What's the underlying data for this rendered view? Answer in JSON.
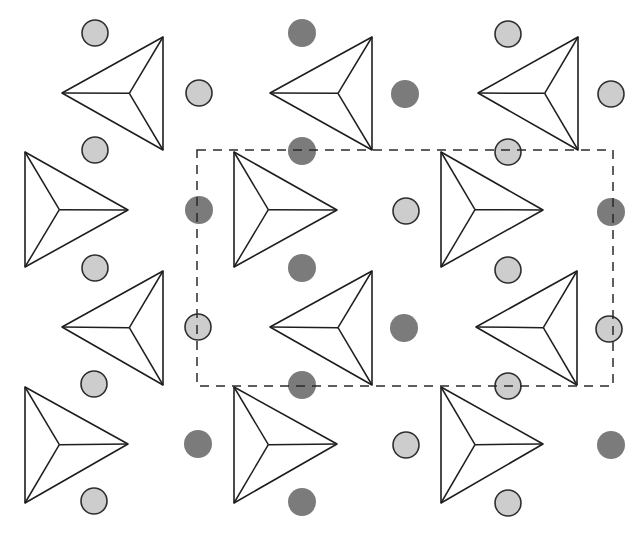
{
  "diagram": {
    "title": "",
    "colors": {
      "background": "#ffffff",
      "line": "#1e1e1e",
      "light_atom_fill": "#cdcdcd",
      "light_atom_stroke": "#2e2e2e",
      "dark_atom_fill": "#7b7b7b",
      "unit_cell": "#2a2a2a"
    },
    "unit_cell": {
      "x": 197,
      "y": 150,
      "width": 416,
      "height": 236,
      "style": "dashed"
    },
    "tetrahedra": [
      {
        "orientation": "left",
        "tip": [
          62,
          93
        ],
        "base_x": 163,
        "top": 37,
        "bottom": 150
      },
      {
        "orientation": "left",
        "tip": [
          270,
          93
        ],
        "base_x": 372,
        "top": 37,
        "bottom": 150
      },
      {
        "orientation": "left",
        "tip": [
          478,
          93
        ],
        "base_x": 578,
        "top": 37,
        "bottom": 150
      },
      {
        "orientation": "right",
        "tip": [
          128,
          210
        ],
        "base_x": 25,
        "top": 152,
        "bottom": 267
      },
      {
        "orientation": "right",
        "tip": [
          337,
          210
        ],
        "base_x": 234,
        "top": 152,
        "bottom": 267
      },
      {
        "orientation": "right",
        "tip": [
          543,
          210
        ],
        "base_x": 441,
        "top": 152,
        "bottom": 267
      },
      {
        "orientation": "left",
        "tip": [
          62,
          327
        ],
        "base_x": 163,
        "top": 271,
        "bottom": 385
      },
      {
        "orientation": "left",
        "tip": [
          270,
          327
        ],
        "base_x": 372,
        "top": 271,
        "bottom": 385
      },
      {
        "orientation": "left",
        "tip": [
          476,
          327
        ],
        "base_x": 577,
        "top": 271,
        "bottom": 385
      },
      {
        "orientation": "right",
        "tip": [
          128,
          444
        ],
        "base_x": 25,
        "top": 387,
        "bottom": 503
      },
      {
        "orientation": "right",
        "tip": [
          337,
          444
        ],
        "base_x": 234,
        "top": 387,
        "bottom": 503
      },
      {
        "orientation": "right",
        "tip": [
          543,
          444
        ],
        "base_x": 441,
        "top": 387,
        "bottom": 503
      }
    ],
    "atoms": [
      {
        "x": 95,
        "y": 33,
        "type": "light"
      },
      {
        "x": 302,
        "y": 33,
        "type": "dark"
      },
      {
        "x": 508,
        "y": 34,
        "type": "light"
      },
      {
        "x": 199,
        "y": 93,
        "type": "light"
      },
      {
        "x": 405,
        "y": 94,
        "type": "dark"
      },
      {
        "x": 611,
        "y": 94,
        "type": "light"
      },
      {
        "x": 95,
        "y": 150,
        "type": "light"
      },
      {
        "x": 302,
        "y": 151,
        "type": "dark"
      },
      {
        "x": 508,
        "y": 152,
        "type": "light"
      },
      {
        "x": 199,
        "y": 210,
        "type": "dark"
      },
      {
        "x": 406,
        "y": 211,
        "type": "light"
      },
      {
        "x": 611,
        "y": 212,
        "type": "dark"
      },
      {
        "x": 95,
        "y": 268,
        "type": "light"
      },
      {
        "x": 302,
        "y": 268,
        "type": "dark"
      },
      {
        "x": 508,
        "y": 270,
        "type": "light"
      },
      {
        "x": 198,
        "y": 327,
        "type": "light"
      },
      {
        "x": 404,
        "y": 328,
        "type": "dark"
      },
      {
        "x": 609,
        "y": 329,
        "type": "light"
      },
      {
        "x": 94,
        "y": 384,
        "type": "light"
      },
      {
        "x": 302,
        "y": 385,
        "type": "dark"
      },
      {
        "x": 508,
        "y": 386,
        "type": "light"
      },
      {
        "x": 198,
        "y": 444,
        "type": "dark"
      },
      {
        "x": 406,
        "y": 445,
        "type": "light"
      },
      {
        "x": 611,
        "y": 445,
        "type": "dark"
      },
      {
        "x": 94,
        "y": 501,
        "type": "light"
      },
      {
        "x": 302,
        "y": 502,
        "type": "dark"
      },
      {
        "x": 508,
        "y": 503,
        "type": "light"
      }
    ]
  }
}
